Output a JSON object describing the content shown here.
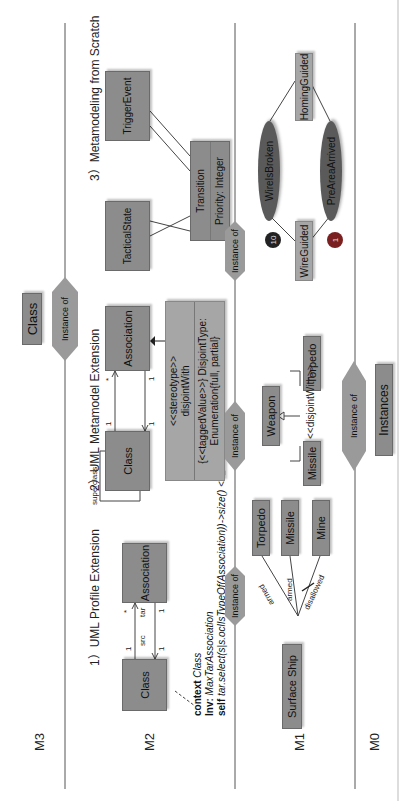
{
  "levels": {
    "m3": "M3",
    "m2": "M2",
    "m1": "M1",
    "m0": "M0"
  },
  "m3": {
    "class_box": "Class",
    "instance_of": "Instance of"
  },
  "sections": {
    "uml_profile": "1）UML Profile Extension",
    "uml_metamodel": "2）UML Metamodel Extension",
    "metamodeling_scratch": "3）Metamodeling from Scratch"
  },
  "profile": {
    "class_box": "Class",
    "association_box": "Association",
    "src_label": "src",
    "tar_label": "tar",
    "mult_src": "1",
    "mult_tar": "*",
    "mult_left": "1",
    "mult_right": "1",
    "ocl": {
      "context_kw": "context",
      "context_val": "Class",
      "inv_kw": "Inv:",
      "inv_val": "MaxTarAssociation",
      "self_kw": "self",
      "self_val": "tar.select(s|s.oclIsTypeOf(Association))->size() <=2"
    }
  },
  "metamodel": {
    "superclass_label": "superclass",
    "class_box": "Class",
    "association_box": "Association",
    "mult_1a": "1",
    "mult_star": "*",
    "mult_1b": "1",
    "mult_1c": "1",
    "stereotype_line1": "<<stereotype>>",
    "stereotype_line2": "disjointWith",
    "tagged_line1": "{<<taggedValue>>} DisjointType:",
    "tagged_line2": "Enumeration{full, partial}"
  },
  "scratch": {
    "tactical_state": "TacticalState",
    "trigger_event": "TriggerEvent",
    "transition": "Transition",
    "priority": "Priority: Integer",
    "mults": [
      "1",
      "1",
      "1",
      "*",
      "1",
      "*",
      "1",
      "1"
    ]
  },
  "m2_m1_instance_labels": [
    "Instance of",
    "Instance of",
    "Instance of"
  ],
  "m1": {
    "surface_ship": "Surface Ship",
    "torpedo": "Torpedo",
    "missile": "Missile",
    "mine": "Mine",
    "armed1": "armed",
    "armed2": "armed",
    "disallowed": "disallowed",
    "weapon": "Weapon",
    "missile2": "Missile",
    "torpedo2": "Torpedo",
    "disjoint_label": "<<disjointWith>>",
    "wire_guided": "WireGuided",
    "homing_guided": "HomingGuided",
    "wire_is_broken": "WireIsBroken",
    "pre_area_arrived": "PreAreaArrived",
    "priority_10": "10",
    "priority_1": "1"
  },
  "m0": {
    "instance_of": "Instance of",
    "instances_box": "Instances"
  },
  "colors": {
    "box": "#8c8c8c",
    "box_light": "#a6a6a6",
    "ellipse": "#5a5a5a",
    "circle_dark": "#222222",
    "circle_red": "#7a2020"
  }
}
